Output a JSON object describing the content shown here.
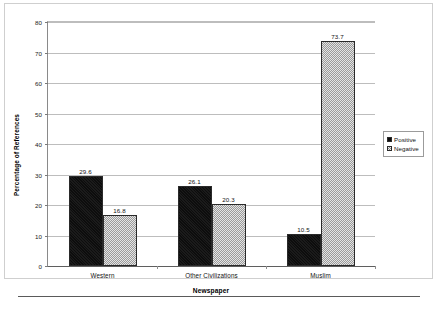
{
  "chart_data": {
    "type": "bar",
    "title": "",
    "subtitle": "",
    "xlabel": "Newspaper",
    "ylabel": "Percentage of References",
    "categories": [
      "Western",
      "Other Civilizations",
      "Muslim"
    ],
    "series": [
      {
        "name": "Positive",
        "values": [
          29.6,
          26.1,
          10.5
        ],
        "color": "#0d0d0d",
        "pattern": "solid-black"
      },
      {
        "name": "Negative",
        "values": [
          16.8,
          20.3,
          73.7
        ],
        "color": "#c9c9c9",
        "pattern": "checkerboard-gray"
      }
    ],
    "ylim": [
      0,
      80
    ],
    "ytick_step": 10,
    "yticks": [
      "80",
      "70",
      "60",
      "50",
      "40",
      "30",
      "20",
      "10",
      "0"
    ],
    "grid": "horizontal",
    "legend_position": "right",
    "value_labels": [
      [
        "29.6",
        "16.8"
      ],
      [
        "26.1",
        "20.3"
      ],
      [
        "10.5",
        "73.7"
      ]
    ]
  },
  "legend": {
    "entries": [
      {
        "label": "Positive",
        "swatch": "black-square-swatch"
      },
      {
        "label": "Negative",
        "swatch": "checkered-square-swatch"
      }
    ]
  }
}
